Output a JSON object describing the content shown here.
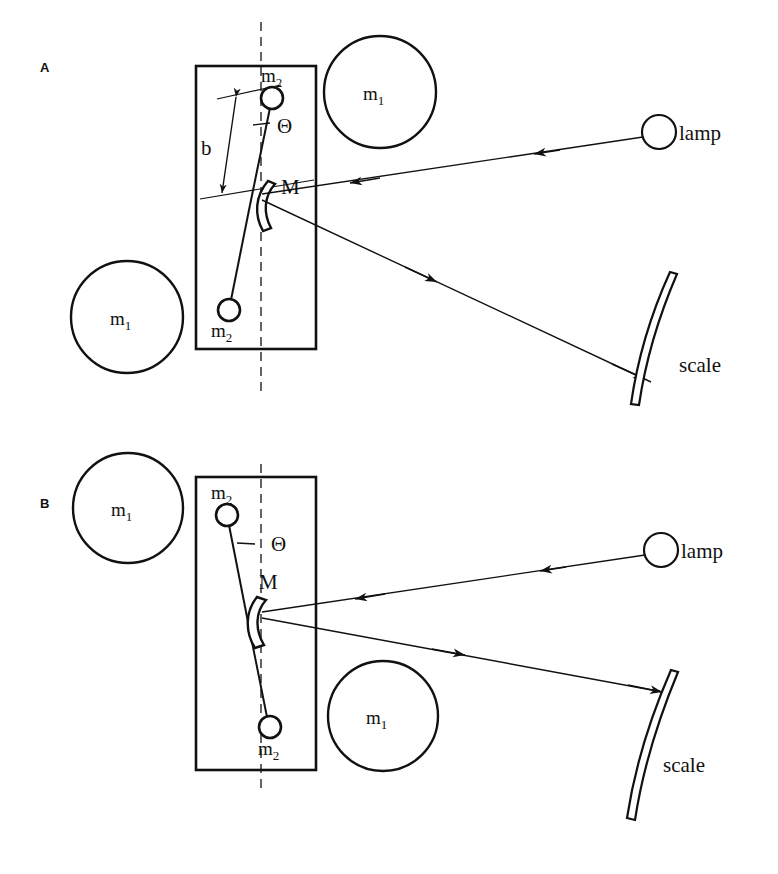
{
  "figure": {
    "background_color": "#ffffff",
    "ink_color": "#111111",
    "panels": [
      {
        "id": "A",
        "label": "A",
        "masses_large": [
          {
            "label_base": "m",
            "label_sub": "1",
            "position": "upper-right"
          },
          {
            "label_base": "m",
            "label_sub": "1",
            "position": "lower-left"
          }
        ],
        "masses_small": [
          {
            "label_base": "m",
            "label_sub": "2",
            "position": "top"
          },
          {
            "label_base": "m",
            "label_sub": "2",
            "position": "bottom"
          }
        ],
        "mirror_label": "M",
        "angle_label": "Θ",
        "arm_label": "b",
        "lamp_label": "lamp",
        "scale_label": "scale"
      },
      {
        "id": "B",
        "label": "B",
        "masses_large": [
          {
            "label_base": "m",
            "label_sub": "1",
            "position": "upper-left"
          },
          {
            "label_base": "m",
            "label_sub": "1",
            "position": "lower-right"
          }
        ],
        "masses_small": [
          {
            "label_base": "m",
            "label_sub": "2",
            "position": "top"
          },
          {
            "label_base": "m",
            "label_sub": "2",
            "position": "bottom"
          }
        ],
        "mirror_label": "M",
        "angle_label": "Θ",
        "lamp_label": "lamp",
        "scale_label": "scale"
      }
    ]
  },
  "panelA": {
    "panel_label": "A",
    "m1_upper": {
      "base": "m",
      "sub": "1"
    },
    "m1_lower": {
      "base": "m",
      "sub": "1"
    },
    "m2_top": {
      "base": "m",
      "sub": "2"
    },
    "m2_bottom": {
      "base": "m",
      "sub": "2"
    },
    "mirror": "M",
    "theta": "Θ",
    "arm": "b",
    "lamp": "lamp",
    "scale": "scale"
  },
  "panelB": {
    "panel_label": "B",
    "m1_upper": {
      "base": "m",
      "sub": "1"
    },
    "m1_lower": {
      "base": "m",
      "sub": "1"
    },
    "m2_top": {
      "base": "m",
      "sub": "2"
    },
    "m2_bottom": {
      "base": "m",
      "sub": "2"
    },
    "mirror": "M",
    "theta": "Θ",
    "lamp": "lamp",
    "scale": "scale"
  }
}
